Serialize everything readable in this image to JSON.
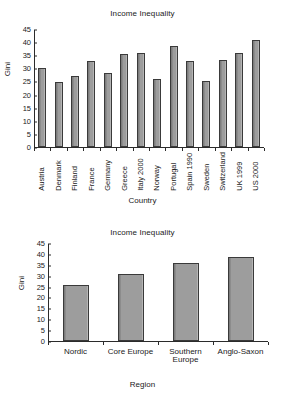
{
  "chart_data": [
    {
      "id": "top",
      "type": "bar",
      "title": "Income Inequality",
      "xlabel": "Country",
      "ylabel": "Gini",
      "ylim": [
        0,
        45
      ],
      "ytick_step": 5,
      "yticks": [
        45,
        40,
        35,
        30,
        25,
        20,
        15,
        10,
        5,
        0
      ],
      "grid": false,
      "legend": "none",
      "bar_color": "#9d9d9d",
      "categories": [
        "Austria",
        "Denmark",
        "Finland",
        "France",
        "Germany",
        "Greece",
        "Italy 2000",
        "Norway",
        "Portugal",
        "Spain 1990",
        "Sweden",
        "Switzerland",
        "UK 1999",
        "US 2000"
      ],
      "values": [
        30.0,
        24.7,
        26.9,
        32.9,
        28.4,
        35.4,
        35.9,
        26.1,
        38.6,
        32.7,
        25.1,
        33.3,
        36.0,
        40.8
      ]
    },
    {
      "id": "bottom",
      "type": "bar",
      "title": "Income Inequality",
      "xlabel": "Region",
      "ylabel": "Gini",
      "ylim": [
        0,
        45
      ],
      "ytick_step": 5,
      "yticks": [
        45,
        40,
        35,
        30,
        25,
        20,
        15,
        10,
        5,
        0
      ],
      "grid": false,
      "legend": "none",
      "bar_color": "#9d9d9d",
      "categories": [
        "Nordic",
        "Core Europe",
        "Southern Europe",
        "Anglo-Saxon"
      ],
      "category_lines": [
        [
          "Nordic"
        ],
        [
          "Core Europe"
        ],
        [
          "Southern",
          "Europe"
        ],
        [
          "Anglo-Saxon"
        ]
      ],
      "values": [
        25.5,
        31.0,
        35.7,
        38.5
      ]
    }
  ]
}
